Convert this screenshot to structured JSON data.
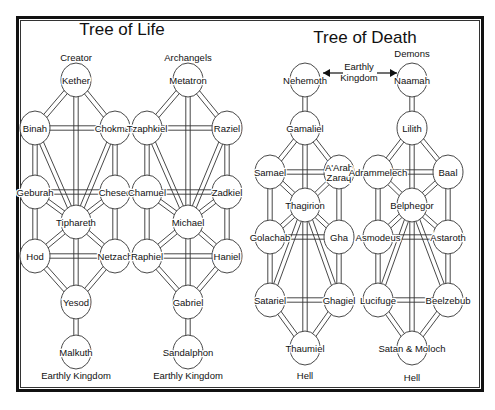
{
  "titles": {
    "life": "Tree of Life",
    "death": "Tree of Death"
  },
  "life_tree_creator": {
    "header": "Creator",
    "footer": "Earthly Kingdom",
    "nodes": [
      "Kether",
      "Binah",
      "Chokmah",
      "Geburah",
      "Chesed",
      "Tiphareth",
      "Hod",
      "Netzach",
      "Yesod",
      "Malkuth"
    ]
  },
  "life_tree_archangels": {
    "header": "Archangels",
    "footer": "Earthly Kingdom",
    "nodes": [
      "Metatron",
      "Tzaphkiel",
      "Raziel",
      "Chamuel",
      "Zadkiel",
      "Michael",
      "Raphiel",
      "Haniel",
      "Gabriel",
      "Sandalphon"
    ]
  },
  "death_tree_left": {
    "footer": "Hell",
    "nodes": [
      "Nehemoth",
      "Gamaliel",
      "Samael",
      "A'Arab Zaraq",
      "Thagirion",
      "Golachab",
      "Gha",
      "Satariel",
      "Ghagiel",
      "Thaumiel"
    ]
  },
  "death_tree_demons": {
    "header": "Demons",
    "footer": "Hell",
    "nodes": [
      "Naamah",
      "Lilith",
      "Adrammelech",
      "Baal",
      "Belphegor",
      "Asmodeus",
      "Astaroth",
      "Lucifuge",
      "Beelzebub",
      "Satan & Moloch"
    ]
  },
  "center_label": {
    "line1": "Earthly",
    "line2": "Kingdom"
  }
}
